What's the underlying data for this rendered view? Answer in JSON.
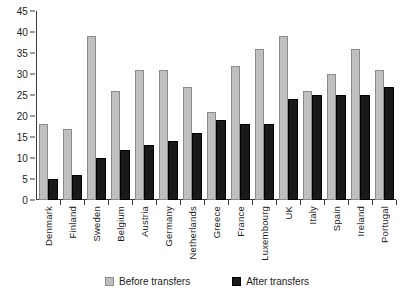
{
  "chart_data": {
    "type": "bar",
    "title": "",
    "xlabel": "",
    "ylabel": "",
    "ylim": [
      0,
      45
    ],
    "yticks": [
      0,
      5,
      10,
      15,
      20,
      25,
      30,
      35,
      40,
      45
    ],
    "grid": false,
    "legend_position": "bottom",
    "categories": [
      "Denmark",
      "Finland",
      "Sweden",
      "Belgium",
      "Austria",
      "Germany",
      "Netherlands",
      "Greece",
      "France",
      "Luxembourg",
      "UK",
      "Italy",
      "Spain",
      "Ireland",
      "Portugal"
    ],
    "series": [
      {
        "name": "Before transfers",
        "color": "#bfbfbf",
        "values": [
          18,
          17,
          39,
          26,
          31,
          31,
          27,
          21,
          32,
          36,
          39,
          26,
          30,
          36,
          31
        ]
      },
      {
        "name": "After transfers",
        "color": "#1a1a1a",
        "values": [
          5,
          6,
          10,
          12,
          13,
          14,
          16,
          19,
          18,
          18,
          24,
          25,
          25,
          25,
          27
        ]
      }
    ]
  },
  "legend": {
    "items": [
      {
        "label": "Before transfers",
        "swatch": "before"
      },
      {
        "label": "After transfers",
        "swatch": "after"
      }
    ]
  }
}
